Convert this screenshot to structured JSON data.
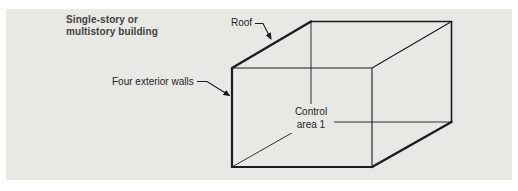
{
  "figure": {
    "type": "isometric-building-diagram",
    "panel_background": "#E8E8E5",
    "line_color": "#1C1C1C",
    "title_color": "#404040",
    "label_color": "#1F1F1F"
  },
  "labels": {
    "building": {
      "line1": "Single-story or",
      "line2": "multistory building"
    },
    "roof": "Roof",
    "walls": "Four exterior walls",
    "control_area": {
      "line1": "Control",
      "line2": "area 1"
    }
  }
}
